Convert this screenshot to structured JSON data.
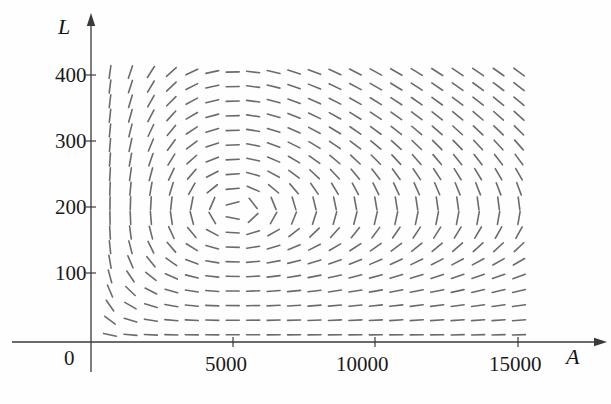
{
  "figure": {
    "type": "direction-field",
    "background_color": "#fefefe",
    "segment_color": "#6b6b6b",
    "axis_color": "#3a3a3a"
  },
  "axes": {
    "x": {
      "name": "A",
      "name_x": 566,
      "name_y": 344,
      "origin_px": 91,
      "axis_y_px": 342,
      "units_per_px": 35.2,
      "arrow_end_px": 598,
      "ticks": [
        {
          "label": "5000",
          "value": 5000,
          "x_px": 233
        },
        {
          "label": "10000",
          "value": 10000,
          "x_px": 375
        },
        {
          "label": "15000",
          "value": 15000,
          "x_px": 518
        }
      ],
      "tick_label_y_px": 352
    },
    "y": {
      "name": "L",
      "name_x": 58,
      "name_y": 14,
      "origin_px": 342,
      "axis_x_px": 91,
      "units_per_px": 1.515,
      "arrow_end_px": 22,
      "ticks": [
        {
          "label": "400",
          "value": 400,
          "y_px": 75
        },
        {
          "label": "300",
          "value": 300,
          "y_px": 141
        },
        {
          "label": "200",
          "value": 200,
          "y_px": 207
        },
        {
          "label": "100",
          "value": 100,
          "y_px": 273
        }
      ],
      "zero_label": "0",
      "zero_label_x_px": 64,
      "zero_label_y_px": 346
    }
  },
  "chart_data": {
    "type": "scatter",
    "title": "",
    "xlabel": "A",
    "ylabel": "L",
    "xlim": [
      0,
      16000
    ],
    "ylim": [
      0,
      430
    ],
    "grid": false,
    "legend": null,
    "equilibrium": {
      "A": 5100,
      "L": 200
    },
    "model": {
      "dA_dt": "k*A*(1 - L/L0)",
      "dL_dt": "-m*L*(1 - A/A0)",
      "A0": 5100,
      "L0": 200
    },
    "grid_spec": {
      "x_start_px": 110,
      "x_step_px": 20.45,
      "x_count": 21,
      "y_start_px": 72,
      "y_step_px": 14.6,
      "y_count": 19,
      "segment_length_px": 13
    },
    "sample_segments": [
      {
        "A": 700,
        "L": 410,
        "slope_sign": "positive-steep"
      },
      {
        "A": 5100,
        "L": 410,
        "slope_sign": "zero"
      },
      {
        "A": 15000,
        "L": 410,
        "slope_sign": "negative-shallow"
      },
      {
        "A": 700,
        "L": 200,
        "slope_sign": "vertical"
      },
      {
        "A": 5100,
        "L": 200,
        "slope_sign": "equilibrium"
      },
      {
        "A": 15000,
        "L": 200,
        "slope_sign": "vertical"
      },
      {
        "A": 700,
        "L": 30,
        "slope_sign": "negative-shallow"
      },
      {
        "A": 5100,
        "L": 30,
        "slope_sign": "zero"
      },
      {
        "A": 15000,
        "L": 30,
        "slope_sign": "positive-shallow"
      }
    ]
  }
}
